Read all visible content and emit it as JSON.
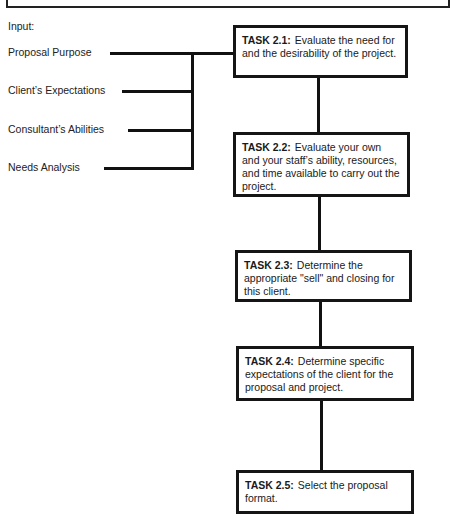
{
  "diagram": {
    "input_heading": "Input:",
    "inputs": [
      {
        "label": "Proposal Purpose"
      },
      {
        "label": "Client’s Expectations"
      },
      {
        "label": "Consultant’s Abilities"
      },
      {
        "label": "Needs Analysis"
      }
    ],
    "tasks": [
      {
        "id": "TASK 2.1:",
        "text": "Evaluate the need for and the desirability of the project."
      },
      {
        "id": "TASK 2.2:",
        "text": "Evaluate your own and your staff’s ability, resources, and time available to carry out the project."
      },
      {
        "id": "TASK 2.3:",
        "text": "Determine the appropriate \"sell\" and closing for this client."
      },
      {
        "id": "TASK 2.4:",
        "text": "Determine specific expectations of the client for the proposal and project."
      },
      {
        "id": "TASK 2.5:",
        "text": "Select the proposal format."
      }
    ],
    "colors": {
      "line": "#111111",
      "box_border": "#151515",
      "background": "#ffffff"
    }
  }
}
